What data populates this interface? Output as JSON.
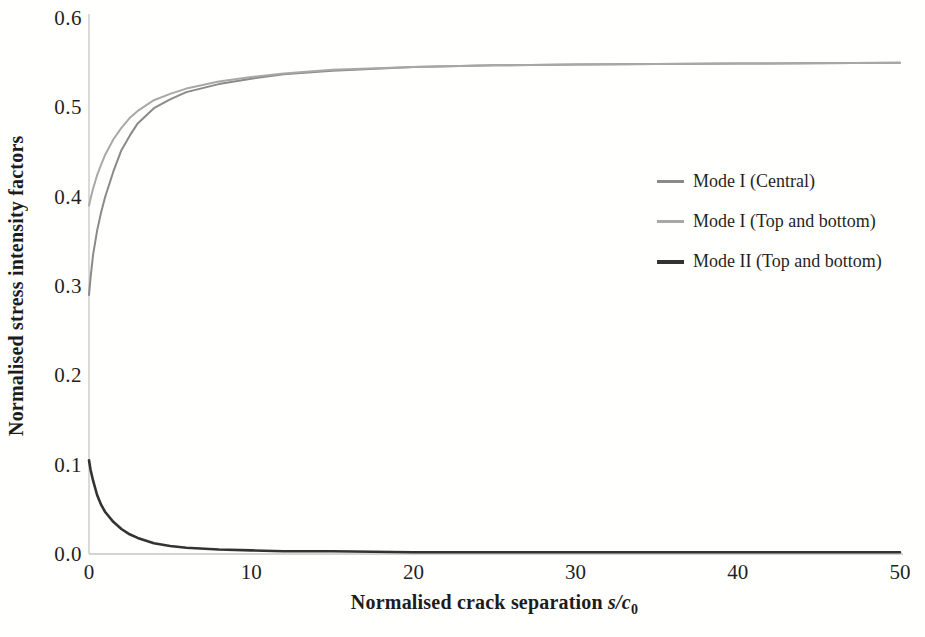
{
  "chart_data": {
    "type": "line",
    "title": "",
    "xlabel": {
      "text": "Normalised crack separation ",
      "math": "s/c",
      "sub": "0"
    },
    "ylabel": "Normalised stress intensity factors",
    "xlim": [
      0,
      50
    ],
    "ylim": [
      0,
      0.6
    ],
    "xticks": [
      "0",
      "10",
      "20",
      "30",
      "40",
      "50"
    ],
    "yticks": [
      "0.0",
      "0.1",
      "0.2",
      "0.3",
      "0.4",
      "0.5",
      "0.6"
    ],
    "grid": false,
    "legend_position": "right-center",
    "axis_color": "#c6c6c6",
    "text_color": "#1c1c1c",
    "x": [
      0,
      0.1,
      0.25,
      0.5,
      0.75,
      1,
      1.5,
      2,
      2.5,
      3,
      4,
      5,
      6,
      8,
      10,
      12,
      15,
      20,
      25,
      30,
      40,
      50
    ],
    "series": [
      {
        "name": "Mode I (Central)",
        "color": "#8a8a8a",
        "stroke_width": 2,
        "asymptote": 0.55,
        "values": [
          0.29,
          0.31,
          0.335,
          0.362,
          0.383,
          0.4,
          0.428,
          0.452,
          0.468,
          0.482,
          0.499,
          0.509,
          0.517,
          0.526,
          0.532,
          0.537,
          0.541,
          0.545,
          0.547,
          0.548,
          0.549,
          0.55
        ]
      },
      {
        "name": "Mode I (Top and bottom)",
        "color": "#a8a8a8",
        "stroke_width": 2,
        "asymptote": 0.55,
        "values": [
          0.39,
          0.398,
          0.409,
          0.424,
          0.436,
          0.447,
          0.464,
          0.477,
          0.488,
          0.496,
          0.508,
          0.515,
          0.521,
          0.529,
          0.534,
          0.538,
          0.542,
          0.545,
          0.547,
          0.548,
          0.549,
          0.55
        ]
      },
      {
        "name": "Mode II (Top and bottom)",
        "color": "#333333",
        "stroke_width": 2.6,
        "asymptote": 0.0,
        "values": [
          0.105,
          0.094,
          0.082,
          0.066,
          0.055,
          0.047,
          0.036,
          0.028,
          0.022,
          0.018,
          0.012,
          0.009,
          0.007,
          0.005,
          0.004,
          0.003,
          0.003,
          0.002,
          0.002,
          0.002,
          0.002,
          0.002
        ]
      }
    ]
  }
}
